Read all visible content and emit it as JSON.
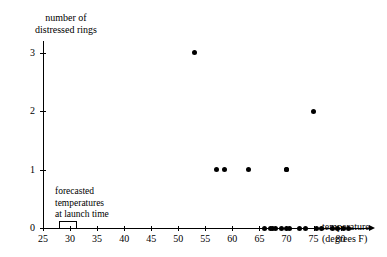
{
  "chart_data": {
    "type": "scatter",
    "title": "",
    "xlabel": "temperature (degrees F)",
    "ylabel": "number of distressed rings",
    "xlabel_line1": "temperature",
    "xlabel_line2": "(degrees F)",
    "ylabel_line1": "number of",
    "ylabel_line2": "distressed rings",
    "xlim": [
      25,
      83
    ],
    "ylim": [
      0,
      3.2
    ],
    "xticks": [
      25,
      30,
      35,
      40,
      45,
      50,
      55,
      60,
      65,
      70,
      75,
      80
    ],
    "yticks": [
      0,
      1,
      2,
      3
    ],
    "grid": false,
    "legend": null,
    "marker_color": "#000000",
    "axis_color": "#000000",
    "points": [
      {
        "x": 53,
        "y": 3
      },
      {
        "x": 75,
        "y": 2
      },
      {
        "x": 57,
        "y": 1
      },
      {
        "x": 58.5,
        "y": 1
      },
      {
        "x": 63,
        "y": 1
      },
      {
        "x": 70,
        "y": 1
      },
      {
        "x": 70,
        "y": 1
      },
      {
        "x": 66,
        "y": 0
      },
      {
        "x": 67,
        "y": 0
      },
      {
        "x": 67.5,
        "y": 0
      },
      {
        "x": 68,
        "y": 0
      },
      {
        "x": 69,
        "y": 0
      },
      {
        "x": 70,
        "y": 0
      },
      {
        "x": 70.5,
        "y": 0
      },
      {
        "x": 72.5,
        "y": 0
      },
      {
        "x": 73.5,
        "y": 0
      },
      {
        "x": 75.5,
        "y": 0
      },
      {
        "x": 76.5,
        "y": 0
      },
      {
        "x": 78.5,
        "y": 0
      },
      {
        "x": 79.5,
        "y": 0
      },
      {
        "x": 80.5,
        "y": 0
      },
      {
        "x": 81.5,
        "y": 0
      }
    ],
    "annotations": [
      {
        "name": "forecasted-temperature-range",
        "text_line1": "forecasted",
        "text_line2": "temperatures",
        "text_line3": "at launch time",
        "x_range": [
          28,
          31
        ]
      }
    ]
  },
  "annotation": {
    "line1": "forecasted",
    "line2": "temperatures",
    "line3": "at launch time"
  },
  "ticklabels": {
    "x": [
      "25",
      "30",
      "35",
      "40",
      "45",
      "50",
      "55",
      "60",
      "65",
      "70",
      "75",
      "80"
    ],
    "y": [
      "0",
      "1",
      "2",
      "3"
    ]
  }
}
